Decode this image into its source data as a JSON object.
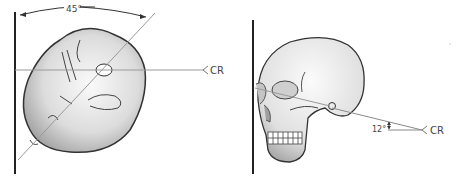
{
  "figure": {
    "left": {
      "description": "Top-down view of head rotated 45 degrees against image receptor",
      "angle_label": "45°",
      "cr_label": "CR"
    },
    "right": {
      "description": "Lateral view of skull with central ray angled 12 degrees",
      "angle_label": "12°",
      "cr_label": "CR"
    }
  },
  "colors": {
    "line": "#222222",
    "ray": "#9a9a9a",
    "skull_fill": "#e6e6e6",
    "skull_shade": "#b8b8b8",
    "text": "#444444"
  }
}
